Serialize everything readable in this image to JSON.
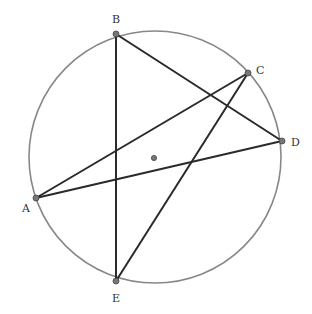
{
  "diagram": {
    "type": "inscribed-pentagram",
    "circle": {
      "cx": 155,
      "cy": 157,
      "r": 126,
      "stroke": "#888888"
    },
    "center": {
      "x": 154,
      "y": 158
    },
    "points": [
      {
        "id": "A",
        "label": "A",
        "x": 36,
        "y": 198,
        "lx": 22,
        "ly": 212
      },
      {
        "id": "B",
        "label": "B",
        "x": 116,
        "y": 34,
        "lx": 112,
        "ly": 23
      },
      {
        "id": "C",
        "label": "C",
        "x": 248,
        "y": 73,
        "lx": 256,
        "ly": 74
      },
      {
        "id": "D",
        "label": "D",
        "x": 282,
        "y": 141,
        "lx": 291,
        "ly": 146
      },
      {
        "id": "E",
        "label": "E",
        "x": 116,
        "y": 281,
        "lx": 112,
        "ly": 302
      }
    ],
    "segments": [
      {
        "from": "B",
        "to": "E"
      },
      {
        "from": "B",
        "to": "D"
      },
      {
        "from": "E",
        "to": "C"
      },
      {
        "from": "C",
        "to": "A"
      },
      {
        "from": "A",
        "to": "D"
      }
    ],
    "segment_color": "#2a2a2a",
    "point_fill": "#777777",
    "point_stroke": "#444444"
  }
}
